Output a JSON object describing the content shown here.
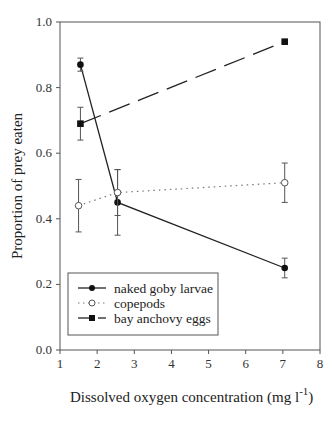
{
  "chart_data": {
    "type": "line",
    "title": "",
    "xlabel": "Dissolved oxygen concentration (mg l",
    "xlabel_superscript": "-1",
    "xlabel_close": ")",
    "ylabel": "Proportion of prey eaten",
    "xlim": [
      1,
      8
    ],
    "ylim": [
      0.0,
      1.0
    ],
    "xticks": [
      "1",
      "2",
      "3",
      "4",
      "5",
      "6",
      "7",
      "8"
    ],
    "yticks": [
      "0.0",
      "0.2",
      "0.4",
      "0.6",
      "0.8",
      "1.0"
    ],
    "grid": false,
    "legend_position": "lower-left",
    "series": [
      {
        "name": "naked goby larvae",
        "marker": "filled-circle",
        "line": "solid",
        "x": [
          1.55,
          2.55,
          7.05
        ],
        "values": [
          0.87,
          0.45,
          0.25
        ],
        "error": [
          0.02,
          0.1,
          0.03
        ]
      },
      {
        "name": "copepods",
        "marker": "open-circle",
        "line": "dotted",
        "x": [
          1.5,
          2.55,
          7.05
        ],
        "values": [
          0.44,
          0.48,
          0.51
        ],
        "error": [
          0.08,
          0.07,
          0.06
        ]
      },
      {
        "name": "bay anchovy eggs",
        "marker": "filled-square",
        "line": "dashed",
        "x": [
          1.55,
          7.05
        ],
        "values": [
          0.69,
          0.94
        ],
        "error": [
          0.05,
          0.0
        ]
      }
    ]
  }
}
